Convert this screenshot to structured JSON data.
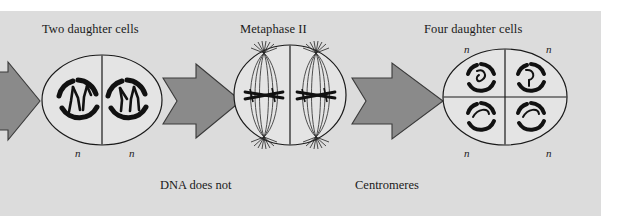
{
  "figure": {
    "domain": "biology-diagram",
    "topic": "Meiosis II",
    "background_color": "#ffffff",
    "panel_color": "#dcdcdc",
    "arrow_color": "#8a8a8a",
    "arrow_outline_color": "#3a3a3a",
    "cell_fill_color": "#e4e4e4",
    "cell_outline_color": "#1a1a1a",
    "chromosome_color": "#111111",
    "text_color": "#1a1a1a"
  },
  "stage_labels": [
    {
      "id": "two-daughter-cells",
      "text": "Two daughter cells",
      "x": 42,
      "y": 22
    },
    {
      "id": "metaphase-ii",
      "text": "Metaphase II",
      "x": 240,
      "y": 22
    },
    {
      "id": "four-daughter-cells",
      "text": "Four daughter cells",
      "x": 424,
      "y": 22
    }
  ],
  "captions": [
    {
      "id": "dna-does-not-replicate",
      "line1": "DNA does not",
      "line2": "replicate",
      "x": 160,
      "y": 148
    },
    {
      "id": "centromeres-divide",
      "line1": "Centromeres",
      "line2": "divide",
      "x": 355,
      "y": 148
    }
  ],
  "ploidy_markers": [
    {
      "id": "n-left-cell-1",
      "text": "n",
      "x": 75,
      "y": 148
    },
    {
      "id": "n-left-cell-2",
      "text": "n",
      "x": 129,
      "y": 148
    },
    {
      "id": "n-four-top-left",
      "text": "n",
      "x": 464,
      "y": 44
    },
    {
      "id": "n-four-top-right",
      "text": "n",
      "x": 546,
      "y": 44
    },
    {
      "id": "n-four-bottom-left",
      "text": "n",
      "x": 464,
      "y": 148
    },
    {
      "id": "n-four-bottom-right",
      "text": "n",
      "x": 546,
      "y": 148
    }
  ],
  "arrows": [
    {
      "id": "arrow-incoming",
      "x": -22,
      "y": 72,
      "width": 62,
      "height": 58
    },
    {
      "id": "arrow-to-metaphase",
      "x": 163,
      "y": 66,
      "width": 82,
      "height": 70
    },
    {
      "id": "arrow-to-four-cells",
      "x": 352,
      "y": 66,
      "width": 96,
      "height": 70
    }
  ],
  "cells": {
    "two_daughter": {
      "id": "two-daughter-cell-group",
      "cx": 102,
      "cy": 100,
      "rx": 60,
      "ry": 45,
      "division_line": true,
      "nuclei": [
        {
          "id": "nucleus-left",
          "cx": 78,
          "cy": 100,
          "r": 20,
          "chromosomes": 2
        },
        {
          "id": "nucleus-right",
          "cx": 127,
          "cy": 100,
          "r": 20,
          "chromosomes": 2
        }
      ]
    },
    "metaphase_ii": {
      "id": "metaphase-ii-cell-group",
      "cx": 290,
      "cy": 95,
      "rx": 56,
      "ry": 50,
      "division_line": true,
      "spindles": [
        {
          "id": "spindle-left",
          "cx": 264,
          "cy": 95
        },
        {
          "id": "spindle-right",
          "cx": 316,
          "cy": 95
        }
      ]
    },
    "four_daughter": {
      "id": "four-daughter-cell-group",
      "cx": 505,
      "cy": 97,
      "rx": 62,
      "ry": 48,
      "division_lines": true,
      "nuclei": [
        {
          "id": "nucleus-top-left",
          "cx": 481,
          "cy": 78,
          "r": 14,
          "chromosomes": 1
        },
        {
          "id": "nucleus-top-right",
          "cx": 531,
          "cy": 78,
          "r": 14,
          "chromosomes": 1
        },
        {
          "id": "nucleus-bottom-left",
          "cx": 481,
          "cy": 117,
          "r": 14,
          "chromosomes": 1
        },
        {
          "id": "nucleus-bottom-right",
          "cx": 531,
          "cy": 117,
          "r": 14,
          "chromosomes": 1
        }
      ]
    }
  }
}
